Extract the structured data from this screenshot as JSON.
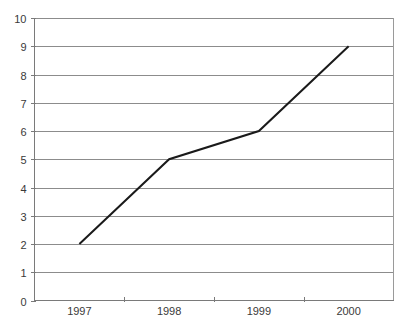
{
  "chart_data": {
    "type": "line",
    "title": "",
    "subtitle": "",
    "xlabel": "",
    "ylabel": "",
    "categories": [
      "1997",
      "1998",
      "1999",
      "2000"
    ],
    "values": [
      2,
      5,
      6,
      9
    ],
    "series": [
      {
        "name": "",
        "values": [
          2,
          5,
          6,
          9
        ]
      }
    ],
    "ylim": [
      0,
      10
    ],
    "y_ticks": [
      0,
      1,
      2,
      3,
      4,
      5,
      6,
      7,
      8,
      9,
      10
    ],
    "y_tick_labels": [
      "0",
      "1",
      "2",
      "3",
      "4",
      "5",
      "6",
      "7",
      "8",
      "9",
      "10"
    ],
    "x_tick_labels": [
      "1997",
      "1998",
      "1999",
      "2000"
    ],
    "grid": true,
    "grid_axis": "y",
    "legend": false,
    "legend_position": "none",
    "line_color": "#1a1a1a",
    "grid_color": "#8c8c8c",
    "axis_color": "#7a7a7a",
    "background_color": "#ffffff",
    "annotations": []
  }
}
